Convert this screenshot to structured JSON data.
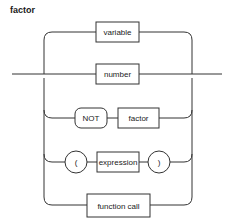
{
  "diagram": {
    "title": "factor",
    "type": "syntax-railroad",
    "nodes": {
      "variable": "variable",
      "number": "number",
      "not": "NOT",
      "factor": "factor",
      "lparen": "(",
      "expression": "expression",
      "rparen": ")",
      "function_call": "function call"
    },
    "branches": [
      {
        "id": "branch-variable",
        "items": [
          "variable"
        ]
      },
      {
        "id": "branch-number",
        "items": [
          "number"
        ]
      },
      {
        "id": "branch-not-factor",
        "items": [
          "NOT",
          "factor"
        ]
      },
      {
        "id": "branch-paren-expression",
        "items": [
          "(",
          "expression",
          ")"
        ]
      },
      {
        "id": "branch-function-call",
        "items": [
          "function call"
        ]
      }
    ],
    "colors": {
      "stroke": "#333333",
      "text": "#222222",
      "background": "#ffffff"
    }
  }
}
